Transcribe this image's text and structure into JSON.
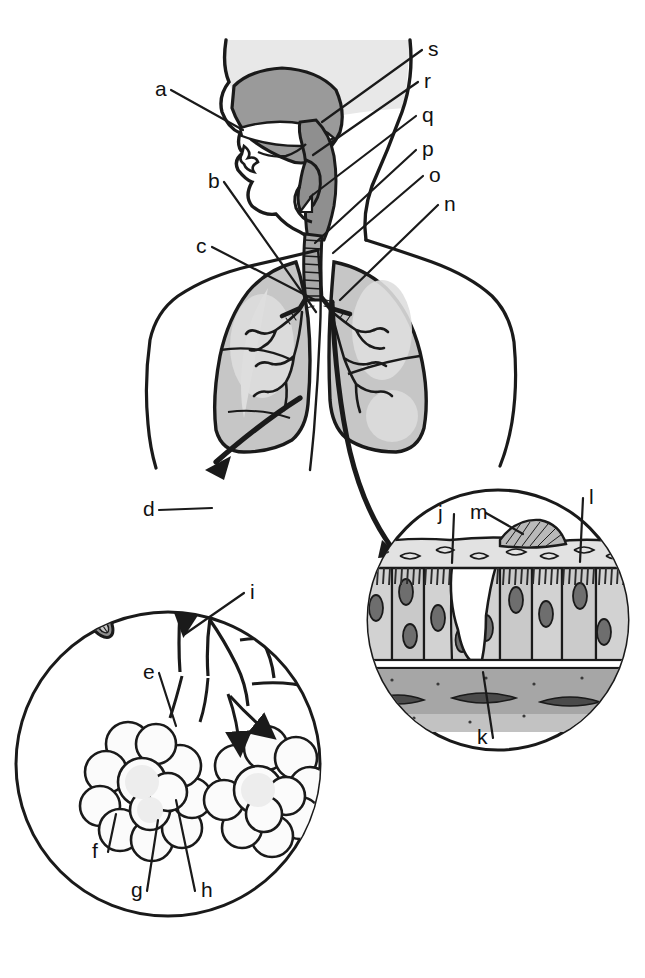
{
  "figure": {
    "background_color": "#ffffff",
    "ink_color": "#1a1a1a",
    "colors": {
      "ink": "#1a1a1a",
      "body_fill": "#ffffff",
      "head_shade": "#e8e8e8",
      "nasal_cavity": "#9a9a9a",
      "airway_dark": "#8f8f8f",
      "lung_fill": "#c6c6c6",
      "lung_highlight": "#dedede",
      "trachea_fill": "#a8a8a8",
      "epithelium_cell": "#d2d2d2",
      "epithelium_cell_shade": "#bdbdbd",
      "nucleus": "#6e6e6e",
      "mucus_layer": "#e2e2e2",
      "goblet_cell": "#ffffff",
      "basement_band": "#b4b4b4",
      "connective_band": "#a6a6a6",
      "cilia": "#2b2b2b"
    }
  },
  "labels": [
    {
      "id": "a",
      "text": "a",
      "x": 155,
      "y": 96,
      "anchor": "start",
      "target_x": 243,
      "target_y": 130,
      "leader": true
    },
    {
      "id": "b",
      "text": "b",
      "x": 208,
      "y": 188,
      "anchor": "start",
      "target_x": 316,
      "target_y": 312,
      "leader": true
    },
    {
      "id": "c",
      "text": "c",
      "x": 196,
      "y": 253,
      "anchor": "start",
      "target_x": 315,
      "target_y": 300,
      "leader": true
    },
    {
      "id": "d",
      "text": "d",
      "x": 143,
      "y": 516,
      "anchor": "start",
      "target_x": 212,
      "target_y": 508,
      "leader": true
    },
    {
      "id": "e",
      "text": "e",
      "x": 143,
      "y": 679,
      "anchor": "start",
      "target_x": 176,
      "target_y": 726,
      "leader": true
    },
    {
      "id": "f",
      "text": "f",
      "x": 92,
      "y": 858,
      "anchor": "start",
      "target_x": 116,
      "target_y": 814,
      "leader": true
    },
    {
      "id": "g",
      "text": "g",
      "x": 131,
      "y": 897,
      "anchor": "start",
      "target_x": 158,
      "target_y": 820,
      "leader": true
    },
    {
      "id": "h",
      "text": "h",
      "x": 201,
      "y": 897,
      "anchor": "start",
      "target_x": 176,
      "target_y": 800,
      "leader": true
    },
    {
      "id": "i",
      "text": "i",
      "x": 250,
      "y": 599,
      "anchor": "start",
      "target_x": 185,
      "target_y": 634,
      "leader": true
    },
    {
      "id": "j",
      "text": "j",
      "x": 438,
      "y": 520,
      "anchor": "start",
      "target_x": 452,
      "target_y": 563,
      "leader": true
    },
    {
      "id": "k",
      "text": "k",
      "x": 477,
      "y": 744,
      "anchor": "start",
      "target_x": 483,
      "target_y": 672,
      "leader": true
    },
    {
      "id": "l",
      "text": "l",
      "x": 589,
      "y": 504,
      "anchor": "start",
      "target_x": 580,
      "target_y": 562,
      "leader": true
    },
    {
      "id": "m",
      "text": "m",
      "x": 470,
      "y": 519,
      "anchor": "start",
      "target_x": 523,
      "target_y": 534,
      "leader": true
    },
    {
      "id": "n",
      "text": "n",
      "x": 444,
      "y": 211,
      "anchor": "start",
      "target_x": 340,
      "target_y": 300,
      "leader": true
    },
    {
      "id": "o",
      "text": "o",
      "x": 429,
      "y": 182,
      "anchor": "start",
      "target_x": 333,
      "target_y": 253,
      "leader": true
    },
    {
      "id": "p",
      "text": "p",
      "x": 422,
      "y": 156,
      "anchor": "start",
      "target_x": 315,
      "target_y": 243,
      "leader": true
    },
    {
      "id": "q",
      "text": "q",
      "x": 422,
      "y": 122,
      "anchor": "start",
      "target_x": 310,
      "target_y": 197,
      "leader": true
    },
    {
      "id": "r",
      "text": "r",
      "x": 424,
      "y": 88,
      "anchor": "start",
      "target_x": 313,
      "target_y": 155,
      "leader": true
    },
    {
      "id": "s",
      "text": "s",
      "x": 428,
      "y": 56,
      "anchor": "start",
      "target_x": 322,
      "target_y": 122,
      "leader": true
    }
  ],
  "regions": {
    "upper_airway": {
      "name": "head-and-upper-airway",
      "description": "Sagittal head, nasal cavity, pharynx, epiglottis, larynx"
    },
    "thorax": {
      "name": "thorax-with-lungs",
      "description": "Torso outline with two shaded lungs and bronchial tree"
    },
    "trachea": {
      "name": "trachea",
      "description": "Ringed tube from larynx to bronchial bifurcation"
    },
    "inset_alveoli": {
      "name": "alveoli-inset-circle",
      "description": "Lower-left circular magnification of bronchiole and alveolar sacs",
      "cx": 168,
      "cy": 764,
      "r": 152
    },
    "inset_epithelium": {
      "name": "epithelium-inset-circle",
      "description": "Right circular magnification of pseudostratified ciliated epithelium with goblet cell",
      "cx": 498,
      "cy": 620,
      "r": 130
    }
  },
  "connectors": [
    {
      "name": "lung-to-alveoli-arrow",
      "from_x": 300,
      "from_y": 400,
      "to_x": 208,
      "to_y": 468,
      "style": "thick-arrow"
    },
    {
      "name": "bronchus-to-epithelium-curve",
      "from_x": 330,
      "from_y": 300,
      "to_x": 390,
      "to_y": 552,
      "style": "thick-curve-arrow"
    }
  ]
}
